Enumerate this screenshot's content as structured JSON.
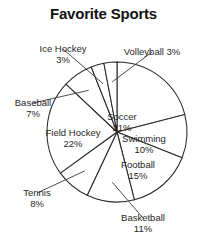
{
  "chart_data": {
    "type": "pie",
    "title": "Favorite Sports",
    "xlabel": "",
    "ylabel": "",
    "legend_position": "none",
    "grid": false,
    "categories": [
      "Soccer",
      "Swimming",
      "Football",
      "Basketball",
      "Tennis",
      "Field Hockey",
      "Baseball",
      "Ice Hockey",
      "Volleyball"
    ],
    "values": [
      21,
      10,
      15,
      11,
      8,
      22,
      7,
      3,
      3
    ],
    "unit": "%",
    "total": 100,
    "start_angle_deg": 0,
    "direction": "clockwise",
    "slices": [
      {
        "label": "Soccer",
        "value": 21,
        "percent_text": "21%",
        "label_text": "Soccer",
        "label_x": 122,
        "label_y": 112,
        "align": "center-align",
        "leader": false
      },
      {
        "label": "Swimming",
        "value": 10,
        "percent_text": "10%",
        "label_text": "Swimming",
        "label_x": 144,
        "label_y": 134,
        "align": "center-align",
        "leader": false
      },
      {
        "label": "Football",
        "value": 15,
        "percent_text": "15%",
        "label_text": "Football",
        "label_x": 138,
        "label_y": 160,
        "align": "center-align",
        "leader": false
      },
      {
        "label": "Basketball",
        "value": 11,
        "percent_text": "11%",
        "label_text": "Basketball",
        "label_x": 143,
        "label_y": 213,
        "align": "center-align",
        "leader": true
      },
      {
        "label": "Tennis",
        "value": 8,
        "percent_text": "8%",
        "label_text": "Tennis",
        "label_x": 37,
        "label_y": 188,
        "align": "center-align",
        "leader": true
      },
      {
        "label": "Field Hockey",
        "value": 22,
        "percent_text": "22%",
        "label_text": "Field Hockey",
        "label_x": 73,
        "label_y": 128,
        "align": "center-align",
        "leader": false
      },
      {
        "label": "Baseball",
        "value": 7,
        "percent_text": "7%",
        "label_text": "Baseball",
        "label_x": 33,
        "label_y": 98,
        "align": "center-align",
        "leader": true
      },
      {
        "label": "Ice Hockey",
        "value": 3,
        "percent_text": "3%",
        "label_text": "Ice Hockey",
        "label_x": 63,
        "label_y": 44,
        "align": "center-align",
        "leader": true
      },
      {
        "label": "Volleyball",
        "value": 3,
        "percent_text": "3%",
        "label_text": "Volleyball 3%",
        "label_x": 152,
        "label_y": 47,
        "align": "center-align",
        "leader": true
      }
    ],
    "geometry": {
      "center_x": 117,
      "center_y": 132,
      "radius": 70
    },
    "colors": {
      "slice_fill": "#ffffff",
      "slice_stroke": "#2a2a2a",
      "text": "#1f1f1f",
      "background": "#ffffff"
    }
  }
}
